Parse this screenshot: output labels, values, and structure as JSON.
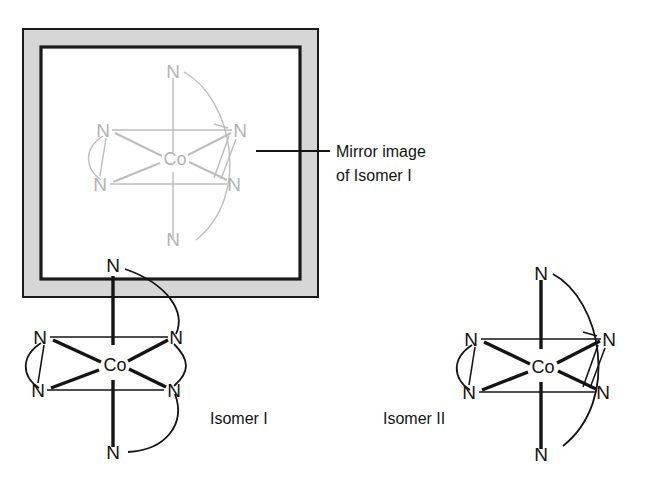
{
  "figure": {
    "kind": "chemical-structure-diagram",
    "background_color": "#ffffff",
    "ink_color": "#141414",
    "ghost_color": "#bdbdbd",
    "mirror_band_color": "#d6d6d6"
  },
  "annotation": {
    "line1": "Mirror image",
    "line2": "of Isomer I",
    "leader_label": "leader-line"
  },
  "captions": {
    "isomer_one": "Isomer I",
    "isomer_two": "Isomer II"
  },
  "atoms": {
    "metal_symbol": "Co",
    "donor_symbol": "N"
  },
  "structures": [
    {
      "id": "mirror-image",
      "caption": "Mirror image of Isomer I",
      "style": "ghost",
      "center_label": "Co",
      "donors": [
        {
          "position": "top",
          "label": "N"
        },
        {
          "position": "upper-left",
          "label": "N"
        },
        {
          "position": "lower-left",
          "label": "N"
        },
        {
          "position": "upper-right",
          "label": "N"
        },
        {
          "position": "lower-right",
          "label": "N"
        },
        {
          "position": "bottom",
          "label": "N"
        }
      ],
      "chelate_rings": 3
    },
    {
      "id": "isomer-i",
      "caption": "Isomer I",
      "style": "solid",
      "center_label": "Co",
      "donors": [
        {
          "position": "top",
          "label": "N"
        },
        {
          "position": "upper-left",
          "label": "N"
        },
        {
          "position": "lower-left",
          "label": "N"
        },
        {
          "position": "upper-right",
          "label": "N"
        },
        {
          "position": "lower-right",
          "label": "N"
        },
        {
          "position": "bottom",
          "label": "N"
        }
      ],
      "chelate_rings": 3
    },
    {
      "id": "isomer-ii",
      "caption": "Isomer II",
      "style": "solid",
      "center_label": "Co",
      "donors": [
        {
          "position": "top",
          "label": "N"
        },
        {
          "position": "upper-left",
          "label": "N"
        },
        {
          "position": "lower-left",
          "label": "N"
        },
        {
          "position": "upper-right",
          "label": "N"
        },
        {
          "position": "lower-right",
          "label": "N"
        },
        {
          "position": "bottom",
          "label": "N"
        }
      ],
      "chelate_rings": 3
    }
  ]
}
